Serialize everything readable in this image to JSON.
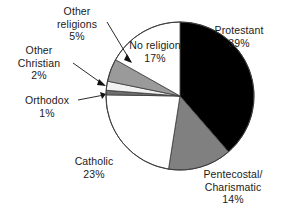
{
  "chart_data": {
    "type": "pie",
    "title": "",
    "subtitle": "",
    "xlabel": "",
    "ylabel": "",
    "legend_position": "none",
    "grid": false,
    "units": "percent",
    "start_angle_deg": 0,
    "direction": "clockwise",
    "categories": [
      "Protestant",
      "Pentecostal/\nCharismatic",
      "Catholic",
      "Orthodox",
      "Other Christian",
      "Other religions",
      "No religion"
    ],
    "values": [
      39,
      14,
      23,
      1,
      2,
      5,
      17
    ],
    "slices": [
      {
        "name": "Protestant",
        "label": "Protestant",
        "value": 39,
        "value_text": "39%",
        "color": "#000000",
        "label_placement": "outside-right",
        "leader_line": false
      },
      {
        "name": "Pentecostal/Charismatic",
        "label": "Pentecostal/\nCharismatic",
        "value": 14,
        "value_text": "14%",
        "color": "#808080",
        "label_placement": "outside-bottom-right",
        "leader_line": false
      },
      {
        "name": "Catholic",
        "label": "Catholic",
        "value": 23,
        "value_text": "23%",
        "color": "#ffffff",
        "label_placement": "outside-bottom-left",
        "leader_line": false
      },
      {
        "name": "Orthodox",
        "label": "Orthodox",
        "value": 1,
        "value_text": "1%",
        "color": "#6e6e6e",
        "label_placement": "outside-left",
        "leader_line": true
      },
      {
        "name": "Other Christian",
        "label": "Other\nChristian",
        "value": 2,
        "value_text": "2%",
        "color": "#f2f2f2",
        "label_placement": "outside-left",
        "leader_line": true
      },
      {
        "name": "Other religions",
        "label": "Other\nreligions",
        "value": 5,
        "value_text": "5%",
        "color": "#9a9a9a",
        "label_placement": "outside-top-left",
        "leader_line": true
      },
      {
        "name": "No religion",
        "label": "No religion",
        "value": 17,
        "value_text": "17%",
        "color": "#ffffff",
        "label_placement": "inside",
        "leader_line": false
      }
    ]
  },
  "labels": {
    "protestant": "Protestant\n39%",
    "pentecostal": "Pentecostal/\nCharismatic\n14%",
    "catholic": "Catholic\n23%",
    "no_religion": "No religion\n17%",
    "other_religions": "Other\nreligions\n5%",
    "other_christian": "Other\nChristian\n2%",
    "orthodox": "Orthodox\n1%"
  },
  "style": {
    "background": "#ffffff",
    "outline": "#3a3a3a",
    "text": "#1a1a1a"
  }
}
